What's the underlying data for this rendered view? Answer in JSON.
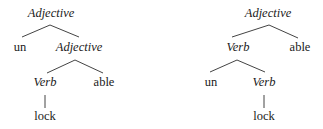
{
  "trees": [
    {
      "id": "left-tree",
      "nodes": {
        "root": "Adjective",
        "un": "un",
        "adj2": "Adjective",
        "verb": "Verb",
        "able": "able",
        "lock": "lock"
      }
    },
    {
      "id": "right-tree",
      "nodes": {
        "root": "Adjective",
        "verb1": "Verb",
        "able": "able",
        "un": "un",
        "verb2": "Verb",
        "lock": "lock"
      }
    }
  ]
}
